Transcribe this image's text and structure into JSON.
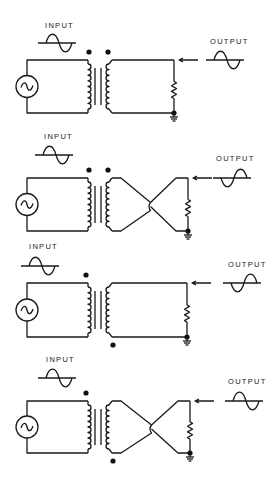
{
  "diagram": {
    "colors": {
      "ink": "#1a1a1a",
      "background": "#ffffff"
    },
    "panels": [
      {
        "id": "panel-1",
        "input_label": "INPUT",
        "output_label": "OUTPUT",
        "secondary_wiring": "straight",
        "dots": "both-top",
        "output_phase": "in-phase",
        "y_top": 60,
        "y_bot": 113,
        "right_x": 174,
        "input_wave": {
          "x": 40,
          "y": 43
        },
        "input_label_pos": {
          "x": 45,
          "y": 28
        },
        "output_wave": {
          "x": 208,
          "y": 60
        },
        "output_label_pos": {
          "x": 210,
          "y": 44
        }
      },
      {
        "id": "panel-2",
        "input_label": "INPUT",
        "output_label": "OUTPUT",
        "secondary_wiring": "crossed",
        "dots": "both-top",
        "output_phase": "inverted",
        "y_top": 178,
        "y_bot": 231,
        "right_x": 188,
        "input_wave": {
          "x": 37,
          "y": 155
        },
        "input_label_pos": {
          "x": 44,
          "y": 139
        },
        "output_wave": {
          "x": 215,
          "y": 178
        },
        "output_label_pos": {
          "x": 216,
          "y": 161
        }
      },
      {
        "id": "panel-3",
        "input_label": "INPUT",
        "output_label": "OUTPUT",
        "secondary_wiring": "straight",
        "dots": "opposite",
        "output_phase": "inverted",
        "y_top": 283,
        "y_bot": 337,
        "right_x": 187,
        "input_wave": {
          "x": 23,
          "y": 266
        },
        "input_label_pos": {
          "x": 29,
          "y": 249
        },
        "output_wave": {
          "x": 225,
          "y": 283
        },
        "output_label_pos": {
          "x": 228,
          "y": 267
        }
      },
      {
        "id": "panel-4",
        "input_label": "INPUT",
        "output_label": "OUTPUT",
        "secondary_wiring": "crossed",
        "dots": "opposite",
        "output_phase": "in-phase",
        "y_top": 401,
        "y_bot": 453,
        "right_x": 190,
        "input_wave": {
          "x": 40,
          "y": 378
        },
        "input_label_pos": {
          "x": 46,
          "y": 362
        },
        "output_wave": {
          "x": 227,
          "y": 401
        },
        "output_label_pos": {
          "x": 228,
          "y": 384
        }
      }
    ],
    "icons": {
      "source": "ac-source-icon",
      "ground": "ground-icon",
      "resistor": "resistor-icon",
      "arrow": "arrow-left-icon"
    }
  }
}
